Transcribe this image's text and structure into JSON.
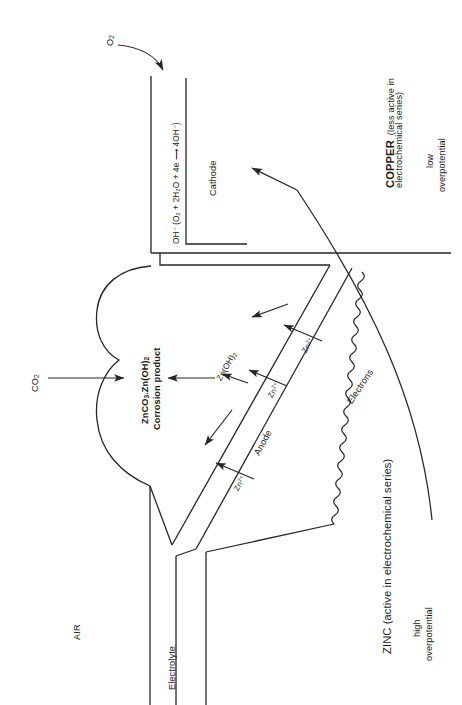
{
  "diagram": {
    "orientation": "rotated-90-ccw",
    "line_color": "#262626",
    "text_color": "#1a1a1a",
    "background": "#ffffff"
  },
  "labels": {
    "oxygen": "O₂",
    "carbon_dioxide": "CO₂",
    "cathode_reaction": "OH⁻ (O₂ + 2H₂O + 4e ⟶ 4OH⁻)",
    "cathode": "Cathode",
    "anode": "Anode",
    "electrons": "Electrons",
    "electrolyte": "Electrolyte",
    "air": "AIR",
    "corrosion_product_line1": "ZnCO₃.Zn(OH)₂",
    "corrosion_product_line2": "Corrosion product",
    "zinc_hydroxide": "Zn(OH)₂",
    "zinc_ion_1": "Zn²⁺",
    "zinc_ion_2": "Zn²⁺",
    "zinc_ion_3": "Zn²⁺",
    "copper_name": "COPPER",
    "copper_note_line1": "(less active in",
    "copper_note_line2": "electrochemical series)",
    "copper_overpotential_line1": "low",
    "copper_overpotential_line2": "overpotential",
    "zinc_name_note": "ZINC (active in electrochemical series)",
    "zinc_overpotential_line1": "high",
    "zinc_overpotential_line2": "overpotential"
  }
}
